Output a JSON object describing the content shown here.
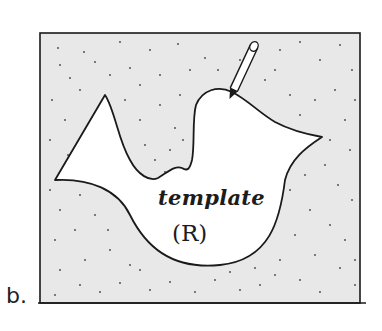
{
  "figure": {
    "panel_label": "b.",
    "template_label": "template",
    "template_symbol": "(R)",
    "colors": {
      "background": "#ffffff",
      "stipple_fill": "#e8e8e8",
      "stipple_dots": "#444444",
      "ink": "#1a1a1a",
      "template_fill": "#ffffff"
    },
    "elements": {
      "box": "stippled rectangular region",
      "shape": "irregular bird-like template region R",
      "tool": "pencil tracing the template outline"
    }
  }
}
